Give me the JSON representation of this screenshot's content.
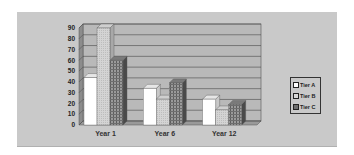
{
  "chart_data": {
    "type": "bar",
    "style": "3d-clustered-column",
    "title": "",
    "xlabel": "",
    "ylabel": "",
    "categories": [
      "Year 1",
      "Year 6",
      "Year 12"
    ],
    "series": [
      {
        "name": "Tier A",
        "values": [
          44,
          34,
          24
        ],
        "color": "#ffffff",
        "pattern": "solid"
      },
      {
        "name": "Tier B",
        "values": [
          90,
          24,
          14
        ],
        "color": "#d8d8d8",
        "pattern": "dotted"
      },
      {
        "name": "Tier C",
        "values": [
          60,
          39,
          19
        ],
        "color": "#8a8a8a",
        "pattern": "grid"
      }
    ],
    "ylim": [
      0,
      90
    ],
    "yticks": [
      0,
      10,
      20,
      30,
      40,
      50,
      60,
      70,
      80,
      90
    ],
    "grid": true,
    "legend_position": "right"
  },
  "legend": {
    "items": [
      {
        "label": "Tier A"
      },
      {
        "label": "Tier B"
      },
      {
        "label": "Tier C"
      }
    ]
  },
  "colors": {
    "background": "#c9c9c9",
    "plot_wall": "#b8b8b8",
    "gridline": "#555555"
  }
}
